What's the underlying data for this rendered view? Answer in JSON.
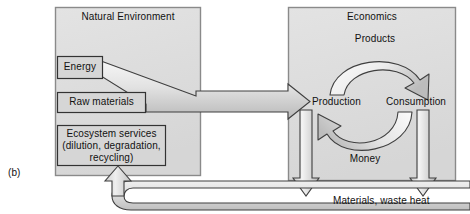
{
  "figure": {
    "letter": "(b)",
    "panels": [
      {
        "id": "natural-environment",
        "title": "Natural Environment"
      },
      {
        "id": "economics",
        "title": "Economics"
      }
    ],
    "natural_environment": {
      "title": "Natural Environment",
      "boxes": [
        {
          "id": "energy",
          "label": "Energy"
        },
        {
          "id": "raw-materials",
          "label": "Raw materials"
        },
        {
          "id": "ecosystem-services",
          "label": "Ecosystem services",
          "line1": "Ecosystem services",
          "line2": "(dilution, degradation,",
          "line3": "recycling)"
        }
      ]
    },
    "economics": {
      "title": "Economics",
      "nodes": [
        {
          "id": "production",
          "label": "Production"
        },
        {
          "id": "consumption",
          "label": "Consumption"
        }
      ],
      "arcs": [
        {
          "id": "products-arc",
          "label": "Products",
          "direction": "production-to-consumption"
        },
        {
          "id": "money-arc",
          "label": "Money",
          "direction": "consumption-to-production"
        }
      ]
    },
    "flows": [
      {
        "id": "inputs-flow",
        "label": "",
        "from": "natural-environment",
        "to": "production"
      },
      {
        "id": "production-waste-flow",
        "label": "",
        "from": "production",
        "to": "materials-waste-heat"
      },
      {
        "id": "consumption-waste-flow",
        "label": "",
        "from": "consumption",
        "to": "materials-waste-heat"
      },
      {
        "id": "feedback-flow",
        "label": "",
        "from": "materials-waste-heat",
        "to": "ecosystem-services"
      }
    ],
    "waste_label": "Materials, waste heat",
    "colors": {
      "panel_fill": "#dcdcdc",
      "panel_stroke": "#808080",
      "box_fill": "#d3d3d3",
      "box_stroke": "#3c3c3c",
      "arrow_stroke": "#4d4d4d",
      "text": "#111111",
      "background": "#ffffff"
    }
  }
}
